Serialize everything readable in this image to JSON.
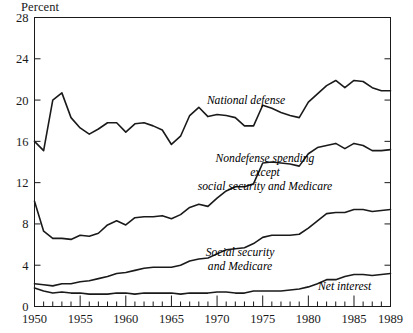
{
  "chart_data": {
    "type": "area",
    "title": "",
    "subtitle": "",
    "ylabel": "Percent",
    "xlabel": "",
    "ylim": [
      0,
      28
    ],
    "xlim": [
      1950,
      1989
    ],
    "grid": false,
    "legend_position": "inline-annotations",
    "stacked": true,
    "yticks": [
      0,
      4,
      8,
      12,
      16,
      20,
      24,
      28
    ],
    "ytick_labels": [
      "0",
      "4",
      "8",
      "12",
      "16",
      "20",
      "24",
      "28"
    ],
    "xticks": [
      1950,
      1955,
      1960,
      1965,
      1970,
      1975,
      1980,
      1985,
      1989
    ],
    "xtick_labels": [
      "1950",
      "1955",
      "1960",
      "1965",
      "1970",
      "1975",
      "1980",
      "1985",
      "1989"
    ],
    "x": [
      1950,
      1951,
      1952,
      1953,
      1954,
      1955,
      1956,
      1957,
      1958,
      1959,
      1960,
      1961,
      1962,
      1963,
      1964,
      1965,
      1966,
      1967,
      1968,
      1969,
      1970,
      1971,
      1972,
      1973,
      1974,
      1975,
      1976,
      1977,
      1978,
      1979,
      1980,
      1981,
      1982,
      1983,
      1984,
      1985,
      1986,
      1987,
      1988,
      1989
    ],
    "series": [
      {
        "name": "Net interest",
        "annotation": "Net interest",
        "values": [
          1.8,
          1.5,
          1.3,
          1.4,
          1.3,
          1.3,
          1.2,
          1.2,
          1.2,
          1.3,
          1.3,
          1.2,
          1.3,
          1.3,
          1.3,
          1.3,
          1.2,
          1.3,
          1.3,
          1.3,
          1.4,
          1.4,
          1.3,
          1.3,
          1.5,
          1.5,
          1.5,
          1.5,
          1.6,
          1.7,
          1.9,
          2.2,
          2.6,
          2.6,
          2.9,
          3.1,
          3.1,
          3.0,
          3.1,
          3.2
        ]
      },
      {
        "name": "Social security and Medicare",
        "annotation": "Social security\nand Medicare",
        "values": [
          0.4,
          0.6,
          0.7,
          0.8,
          0.9,
          1.1,
          1.3,
          1.5,
          1.7,
          1.9,
          2.0,
          2.3,
          2.4,
          2.5,
          2.5,
          2.5,
          2.8,
          3.1,
          3.3,
          3.4,
          3.7,
          4.1,
          4.3,
          4.4,
          4.6,
          5.2,
          5.4,
          5.4,
          5.3,
          5.3,
          5.7,
          6.1,
          6.4,
          6.5,
          6.2,
          6.3,
          6.3,
          6.2,
          6.2,
          6.2
        ]
      },
      {
        "name": "Nondefense spending except social security and Medicare",
        "annotation": "Nondefense spending\nexcept\nsocial security and Medicare",
        "values": [
          8.0,
          5.2,
          4.6,
          4.4,
          4.3,
          4.5,
          4.3,
          4.4,
          5.0,
          5.1,
          4.6,
          5.1,
          5.0,
          4.9,
          5.0,
          4.7,
          4.9,
          5.2,
          5.3,
          5.0,
          5.4,
          5.7,
          6.0,
          5.9,
          5.8,
          7.2,
          7.1,
          7.0,
          6.9,
          6.6,
          7.2,
          7.1,
          6.6,
          6.7,
          6.2,
          6.4,
          6.2,
          5.9,
          5.8,
          5.8
        ]
      },
      {
        "name": "National defense",
        "annotation": "National defense",
        "values": [
          5.8,
          7.8,
          13.4,
          14.1,
          11.8,
          10.4,
          9.9,
          10.1,
          9.9,
          9.5,
          9.0,
          9.1,
          9.1,
          8.8,
          8.3,
          7.2,
          7.6,
          8.9,
          9.4,
          8.7,
          8.1,
          7.3,
          6.7,
          5.9,
          5.6,
          5.6,
          5.2,
          4.9,
          4.7,
          4.7,
          5.0,
          5.2,
          5.8,
          6.1,
          5.9,
          6.1,
          6.2,
          6.1,
          5.8,
          5.7
        ]
      }
    ],
    "cumulative_top_boundaries": {
      "net_interest_top": [
        1.8,
        1.5,
        1.3,
        1.4,
        1.3,
        1.3,
        1.2,
        1.2,
        1.2,
        1.3,
        1.3,
        1.2,
        1.3,
        1.3,
        1.3,
        1.3,
        1.2,
        1.3,
        1.3,
        1.3,
        1.4,
        1.4,
        1.3,
        1.3,
        1.5,
        1.5,
        1.5,
        1.5,
        1.6,
        1.7,
        1.9,
        2.2,
        2.6,
        2.6,
        2.9,
        3.1,
        3.1,
        3.0,
        3.1,
        3.2
      ],
      "social_security_top": [
        2.2,
        2.1,
        2.0,
        2.2,
        2.2,
        2.4,
        2.5,
        2.7,
        2.9,
        3.2,
        3.3,
        3.5,
        3.7,
        3.8,
        3.8,
        3.8,
        4.0,
        4.4,
        4.6,
        4.7,
        5.1,
        5.5,
        5.6,
        5.7,
        6.1,
        6.7,
        6.9,
        6.9,
        6.9,
        7.0,
        7.6,
        8.3,
        9.0,
        9.1,
        9.1,
        9.4,
        9.4,
        9.2,
        9.3,
        9.4
      ],
      "nondefense_top": [
        10.2,
        7.3,
        6.6,
        6.6,
        6.5,
        6.9,
        6.8,
        7.1,
        7.9,
        8.3,
        7.9,
        8.6,
        8.7,
        8.7,
        8.8,
        8.5,
        8.9,
        9.6,
        9.9,
        9.7,
        10.5,
        11.2,
        11.6,
        11.6,
        11.9,
        13.9,
        14.0,
        13.9,
        13.8,
        13.6,
        14.8,
        15.4,
        15.6,
        15.8,
        15.3,
        15.8,
        15.6,
        15.1,
        15.1,
        15.2
      ],
      "total_outlays_top": [
        16.0,
        15.1,
        20.0,
        20.7,
        18.3,
        17.3,
        16.7,
        17.2,
        17.8,
        17.8,
        16.9,
        17.7,
        17.8,
        17.5,
        17.1,
        15.7,
        16.5,
        18.5,
        19.3,
        18.4,
        18.6,
        18.5,
        18.3,
        17.5,
        17.5,
        19.5,
        19.2,
        18.8,
        18.5,
        18.3,
        19.8,
        20.6,
        21.4,
        21.9,
        21.2,
        21.9,
        21.8,
        21.2,
        20.9,
        20.9
      ]
    }
  },
  "annotations": {
    "national_defense": "National defense",
    "nondefense_line1": "Nondefense spending",
    "nondefense_line2": "except",
    "nondefense_line3": "social security and Medicare",
    "social_security_line1": "Social security",
    "social_security_line2": "and Medicare",
    "net_interest": "Net interest"
  },
  "colors": {
    "line": "#1a1a1a",
    "axis": "#1a1a1a",
    "background": "#ffffff"
  }
}
